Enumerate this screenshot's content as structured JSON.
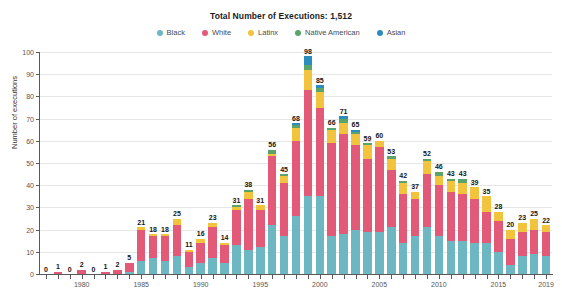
{
  "header": {
    "title": "Total Number of Executions: 1,512"
  },
  "legend": {
    "position": "top-center",
    "items": [
      {
        "label": "Black",
        "color": "#6cb7c2"
      },
      {
        "label": "White",
        "color": "#e25a77"
      },
      {
        "label": "Latinx",
        "color": "#f2c43d"
      },
      {
        "label": "Native American",
        "color": "#5aa469"
      },
      {
        "label": "Asian",
        "color": "#2b8cbe"
      }
    ]
  },
  "chart_data": {
    "type": "bar",
    "stacked": true,
    "title": "Total Number of Executions: 1,512",
    "xlabel": "",
    "ylabel": "Number of executions",
    "ylim": [
      0,
      100
    ],
    "ytick_step": 10,
    "yticks": [
      0,
      10,
      20,
      30,
      40,
      50,
      60,
      70,
      80,
      90,
      100
    ],
    "grid": true,
    "xticks": [
      "1980",
      "1985",
      "1990",
      "1995",
      "2000",
      "2005",
      "2010",
      "2015",
      "2019"
    ],
    "categories": [
      "1977",
      "1978",
      "1979",
      "1980",
      "1981",
      "1982",
      "1983",
      "1984",
      "1985",
      "1986",
      "1987",
      "1988",
      "1989",
      "1990",
      "1991",
      "1992",
      "1993",
      "1994",
      "1995",
      "1996",
      "1997",
      "1998",
      "1999",
      "2000",
      "2001",
      "2002",
      "2003",
      "2004",
      "2005",
      "2006",
      "2007",
      "2008",
      "2009",
      "2010",
      "2011",
      "2012",
      "2013",
      "2014",
      "2015",
      "2016",
      "2017",
      "2018",
      "2019"
    ],
    "totals": [
      0,
      1,
      0,
      2,
      0,
      1,
      2,
      5,
      21,
      18,
      18,
      25,
      11,
      16,
      23,
      14,
      31,
      38,
      31,
      56,
      45,
      68,
      98,
      85,
      66,
      71,
      65,
      59,
      60,
      53,
      42,
      37,
      52,
      46,
      43,
      43,
      39,
      35,
      28,
      20,
      23,
      25,
      22
    ],
    "series": [
      {
        "name": "Black",
        "color": "#6cb7c2",
        "values": [
          0,
          0,
          0,
          0,
          0,
          0,
          0,
          1,
          6,
          7,
          6,
          8,
          3,
          5,
          7,
          5,
          13,
          11,
          12,
          22,
          17,
          26,
          35,
          35,
          17,
          18,
          20,
          19,
          19,
          21,
          14,
          17,
          21,
          17,
          15,
          15,
          14,
          14,
          10,
          4,
          8,
          9,
          8
        ]
      },
      {
        "name": "White",
        "color": "#e25a77",
        "values": [
          0,
          1,
          0,
          2,
          0,
          1,
          2,
          4,
          14,
          10,
          11,
          14,
          7,
          9,
          14,
          8,
          16,
          23,
          17,
          31,
          24,
          34,
          48,
          40,
          42,
          45,
          38,
          33,
          38,
          26,
          22,
          17,
          24,
          23,
          22,
          21,
          20,
          14,
          14,
          12,
          11,
          11,
          11
        ]
      },
      {
        "name": "Latinx",
        "color": "#f2c43d",
        "values": [
          0,
          0,
          0,
          0,
          0,
          0,
          0,
          0,
          1,
          1,
          1,
          3,
          1,
          2,
          2,
          1,
          1,
          3,
          2,
          1,
          3,
          6,
          9,
          7,
          6,
          5,
          5,
          6,
          3,
          5,
          5,
          3,
          6,
          4,
          5,
          5,
          5,
          7,
          4,
          4,
          4,
          5,
          3
        ]
      },
      {
        "name": "Native American",
        "color": "#5aa469",
        "values": [
          0,
          0,
          0,
          0,
          0,
          0,
          0,
          0,
          0,
          0,
          0,
          0,
          0,
          0,
          0,
          0,
          1,
          1,
          0,
          2,
          1,
          1,
          2,
          2,
          1,
          2,
          1,
          1,
          0,
          1,
          1,
          0,
          1,
          2,
          1,
          2,
          0,
          0,
          0,
          0,
          0,
          0,
          0
        ]
      },
      {
        "name": "Asian",
        "color": "#2b8cbe",
        "values": [
          0,
          0,
          0,
          0,
          0,
          0,
          0,
          0,
          0,
          0,
          0,
          0,
          0,
          0,
          0,
          0,
          0,
          0,
          0,
          0,
          0,
          1,
          4,
          1,
          0,
          1,
          1,
          0,
          0,
          0,
          0,
          0,
          0,
          0,
          0,
          0,
          0,
          0,
          0,
          0,
          0,
          0,
          0
        ]
      }
    ]
  }
}
